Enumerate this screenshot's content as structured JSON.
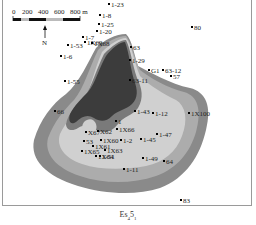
{
  "map": {
    "caption_main": "Es",
    "caption_sub1": "4",
    "caption_mid": "5",
    "caption_sub2": "1",
    "scale_bar": {
      "ticks": [
        "0",
        "200",
        "400",
        "600",
        "800 m"
      ]
    },
    "north_label": "N",
    "colors": {
      "zone_darkest": "#3c3c3c",
      "zone_dark": "#7f7f7f",
      "zone_mid": "#a9a9a9",
      "zone_light": "#cfcfcf",
      "background": "#ffffff",
      "frame": "#9a9a9a"
    },
    "wells": [
      {
        "name": "1-23",
        "x": 109,
        "y": 4
      },
      {
        "name": "1-8",
        "x": 100,
        "y": 15
      },
      {
        "name": "1-25",
        "x": 99,
        "y": 24
      },
      {
        "name": "1-20",
        "x": 97,
        "y": 31
      },
      {
        "name": "1-7",
        "x": 83,
        "y": 37
      },
      {
        "name": "1-53",
        "x": 68,
        "y": 45
      },
      {
        "name": "1X69",
        "x": 85,
        "y": 42
      },
      {
        "name": "1X68",
        "x": 92,
        "y": 43
      },
      {
        "name": "1-6",
        "x": 61,
        "y": 56
      },
      {
        "name": "63",
        "x": 131,
        "y": 47
      },
      {
        "name": "1-29",
        "x": 130,
        "y": 60
      },
      {
        "name": "G1",
        "x": 149,
        "y": 70
      },
      {
        "name": "63-12",
        "x": 163,
        "y": 70
      },
      {
        "name": "57",
        "x": 171,
        "y": 76
      },
      {
        "name": "80",
        "x": 192,
        "y": 27
      },
      {
        "name": "1-55",
        "x": 65,
        "y": 81
      },
      {
        "name": "63-11",
        "x": 130,
        "y": 80
      },
      {
        "name": "66",
        "x": 55,
        "y": 111
      },
      {
        "name": "1-43",
        "x": 135,
        "y": 111
      },
      {
        "name": "1-12",
        "x": 153,
        "y": 113
      },
      {
        "name": "1X100",
        "x": 189,
        "y": 113
      },
      {
        "name": "1",
        "x": 116,
        "y": 121
      },
      {
        "name": "1X66",
        "x": 117,
        "y": 129
      },
      {
        "name": "X67",
        "x": 86,
        "y": 132
      },
      {
        "name": "X62",
        "x": 98,
        "y": 131
      },
      {
        "name": "1-45",
        "x": 141,
        "y": 139
      },
      {
        "name": "1-47",
        "x": 157,
        "y": 134
      },
      {
        "name": "53",
        "x": 84,
        "y": 141
      },
      {
        "name": "1X60",
        "x": 101,
        "y": 140
      },
      {
        "name": "1-2",
        "x": 121,
        "y": 140
      },
      {
        "name": "1X61",
        "x": 93,
        "y": 146
      },
      {
        "name": "1X65",
        "x": 82,
        "y": 151
      },
      {
        "name": "1X63",
        "x": 105,
        "y": 150
      },
      {
        "name": "1X64",
        "x": 96,
        "y": 156
      },
      {
        "name": "1-51",
        "x": 100,
        "y": 156
      },
      {
        "name": "1-49",
        "x": 143,
        "y": 158
      },
      {
        "name": "64",
        "x": 164,
        "y": 161
      },
      {
        "name": "1-11",
        "x": 124,
        "y": 169
      },
      {
        "name": "83",
        "x": 181,
        "y": 200
      }
    ]
  }
}
